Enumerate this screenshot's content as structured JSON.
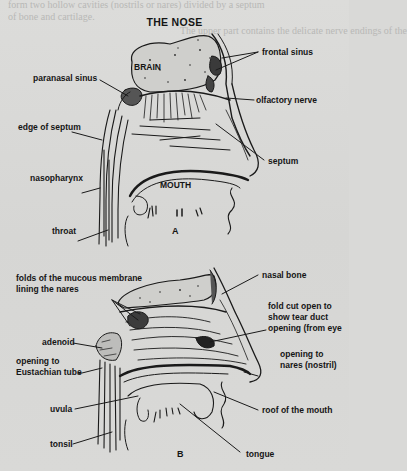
{
  "title": "THE NOSE",
  "figure_a": {
    "caption": "A",
    "labels": {
      "brain": "BRAIN",
      "frontal_sinus": "frontal sinus",
      "paranasal_sinus": "paranasal sinus",
      "olfactory_nerve": "olfactory nerve",
      "edge_of_septum": "edge of septum",
      "septum": "septum",
      "nasopharynx": "nasopharynx",
      "mouth": "MOUTH",
      "throat": "throat"
    }
  },
  "figure_b": {
    "caption": "B",
    "labels": {
      "folds_line1": "folds of the mucous membrane",
      "folds_line2": "lining the nares",
      "nasal_bone": "nasal bone",
      "fold_cut_line1": "fold cut open to",
      "fold_cut_line2": "show tear duct",
      "fold_cut_line3": "opening (from eye",
      "adenoid": "adenoid",
      "eustachian_line1": "opening to",
      "eustachian_line2": "Eustachian tube",
      "nares_line1": "opening to",
      "nares_line2": "nares (nostril)",
      "uvula": "uvula",
      "roof_of_mouth": "roof of the mouth",
      "tonsil": "tonsil",
      "tongue": "tongue"
    }
  },
  "bleed_text": [
    "form two hollow cavities (nostrils or nares) divided by a septum",
    "of bone and cartilage.",
    "The upper part contains the delicate nerve endings of the",
    "olfactory nerve and provide the sense of smell, which it controls",
    "with the nasal cavity. The lower part lined with hairs"
  ],
  "colors": {
    "paper": "#d9d9d7",
    "ink": "#151515"
  }
}
